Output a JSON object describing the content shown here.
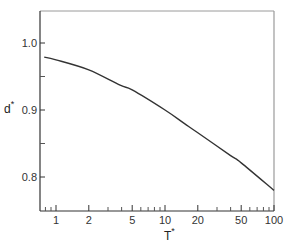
{
  "chart_data": {
    "type": "line",
    "title": "",
    "xlabel": "T*",
    "ylabel": "d*",
    "xscale": "log",
    "xlim": [
      0.71,
      100
    ],
    "ylim": [
      0.749,
      1.048
    ],
    "grid": false,
    "legend": null,
    "x_ticks": [
      {
        "value": 1,
        "label": "1"
      },
      {
        "value": 2,
        "label": "2"
      },
      {
        "value": 5,
        "label": "5"
      },
      {
        "value": 10,
        "label": "10"
      },
      {
        "value": 20,
        "label": "20"
      },
      {
        "value": 50,
        "label": "50"
      },
      {
        "value": 100,
        "label": "100"
      }
    ],
    "x_minor_ticks": [
      0.8,
      0.9,
      3,
      4,
      6,
      7,
      8,
      9,
      30,
      40,
      60,
      70,
      80,
      90
    ],
    "y_ticks": [
      {
        "value": 1.0,
        "label": "1.0"
      },
      {
        "value": 0.9,
        "label": "0.9"
      },
      {
        "value": 0.8,
        "label": "0.8"
      }
    ],
    "y_minor_ticks": [
      0.95,
      0.85
    ],
    "series": [
      {
        "name": "d*",
        "color": "#333333",
        "x": [
          0.78,
          1,
          2,
          3.87,
          5,
          10,
          15,
          20,
          40,
          50,
          100
        ],
        "y": [
          0.979,
          0.975,
          0.96,
          0.937,
          0.93,
          0.9,
          0.88,
          0.866,
          0.832,
          0.821,
          0.78
        ]
      }
    ]
  },
  "labels": {
    "x_main": "T",
    "x_sup": "*",
    "y_main": "d",
    "y_sup": "*"
  }
}
